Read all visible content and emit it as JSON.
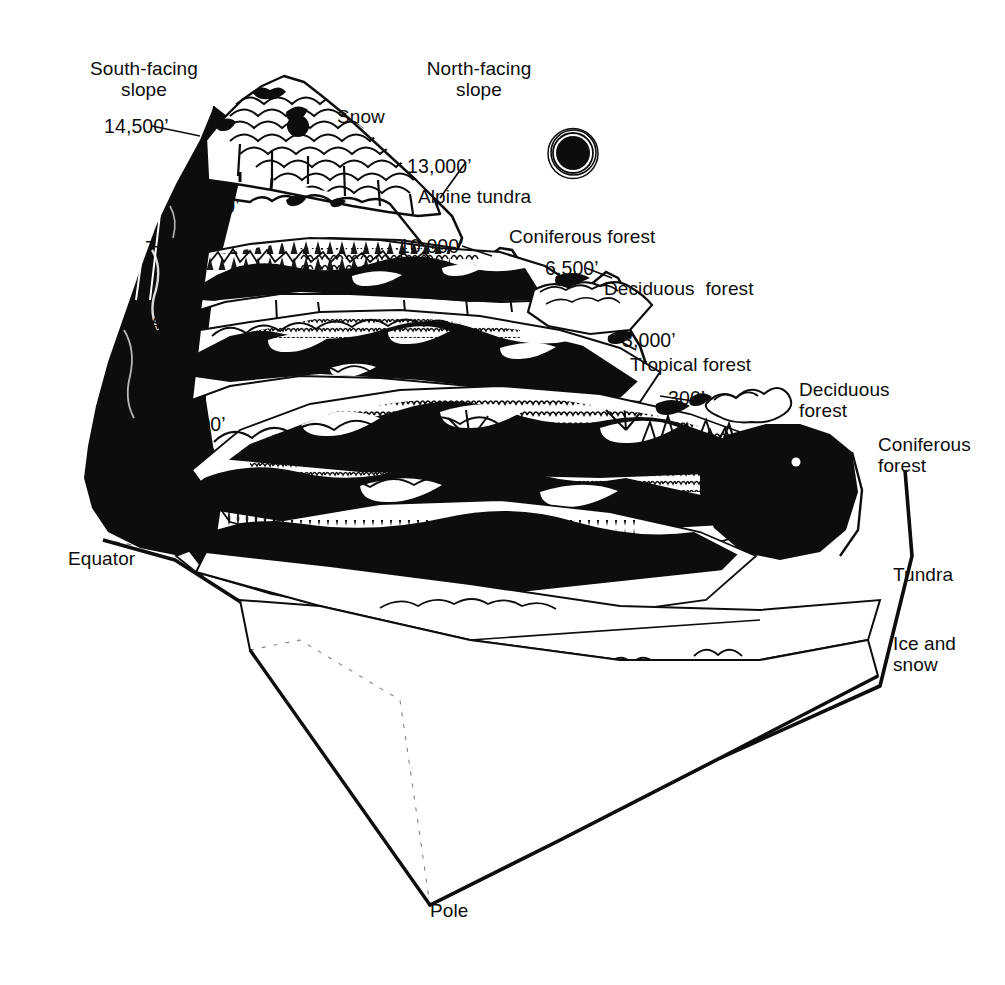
{
  "figure": {
    "kind": "scientific-line-illustration",
    "background_color": "#ffffff",
    "ink_color": "#0d0d0d"
  },
  "slope_labels": {
    "south_facing": "South-facing\nslope",
    "north_facing": "North-facing\nslope"
  },
  "elevations": [
    {
      "id": "e14500",
      "text": "14,500’",
      "x": 104,
      "y": 116
    },
    {
      "id": "e13000",
      "text": "13,000’",
      "x": 407,
      "y": 156
    },
    {
      "id": "e12000",
      "text": "12,000’",
      "x": 175,
      "y": 196
    },
    {
      "id": "e10000",
      "text": "10,000’",
      "x": 399,
      "y": 236
    },
    {
      "id": "e7500",
      "text": "7,500’",
      "x": 145,
      "y": 238
    },
    {
      "id": "e6500",
      "text": "6,500’",
      "x": 545,
      "y": 258
    },
    {
      "id": "e4000",
      "text": "4,000’",
      "x": 150,
      "y": 312
    },
    {
      "id": "e3000",
      "text": "3,000’",
      "x": 622,
      "y": 330
    },
    {
      "id": "e1800",
      "text": "1,800’",
      "x": 172,
      "y": 414
    },
    {
      "id": "e300",
      "text": "300’",
      "x": 668,
      "y": 388
    }
  ],
  "zone_labels": {
    "snow": "Snow",
    "alpine_tundra": "Alpine tundra",
    "coniferous_forest_upper": "Coniferous forest",
    "deciduous_forest_upper": "Deciduous  forest",
    "tropical_forest": "Tropical forest",
    "deciduous_forest_right": "Deciduous\nforest",
    "coniferous_forest_right": "Coniferous\nforest",
    "tundra": "Tundra",
    "ice_and_snow": "Ice and\nsnow"
  },
  "latitude_labels": {
    "equator": "Equator",
    "pole": "Pole"
  },
  "sun": {
    "name": "sun-disk",
    "cx": 573,
    "cy": 153,
    "r": 23
  }
}
